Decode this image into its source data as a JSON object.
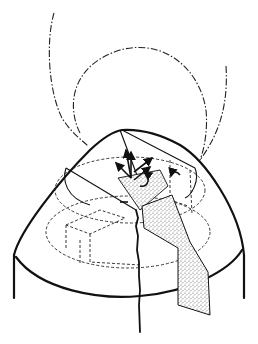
{
  "figure": {
    "colors": {
      "background": "#ffffff",
      "ink": "#111111",
      "stipple": "#9a9a9a"
    },
    "elements": [
      "cone-outline",
      "cylinder-base",
      "dashdot-circle",
      "dashdot-outer-curve",
      "hidden-dashed-lines",
      "inner-cut-sector",
      "stippled-wedge",
      "crack-line",
      "vector-arrows"
    ]
  }
}
